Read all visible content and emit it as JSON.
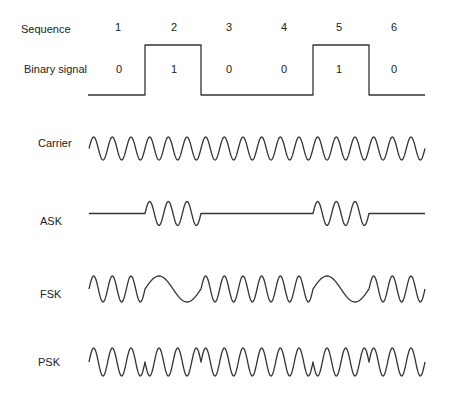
{
  "labels": {
    "sequence": "Sequence",
    "binary": "Binary signal",
    "carrier": "Carrier",
    "ask": "ASK",
    "fsk": "FSK",
    "psk": "PSK"
  },
  "sequence": [
    "1",
    "2",
    "3",
    "4",
    "5",
    "6"
  ],
  "bits": [
    "0",
    "1",
    "0",
    "0",
    "1",
    "0"
  ],
  "layout": {
    "x0": 89,
    "bit_width": 56,
    "cycles_per_bit": 3,
    "stroke_color": "#333333"
  }
}
